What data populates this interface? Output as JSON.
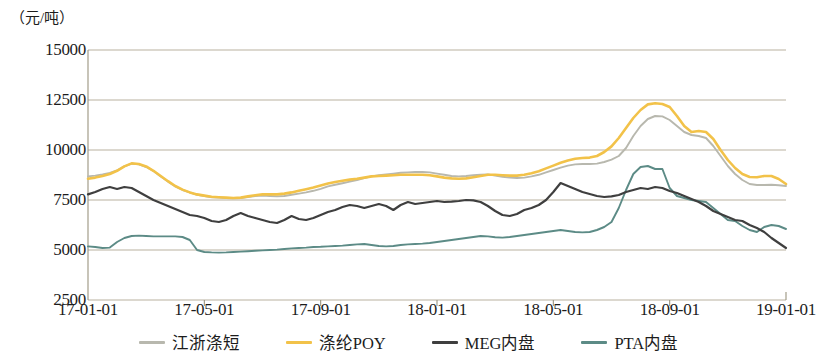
{
  "chart_data": {
    "type": "line",
    "title": "",
    "unit_label": "（元/吨）",
    "ylabel": "",
    "xlabel": "",
    "ylim": [
      2500,
      15000
    ],
    "yticks": [
      15000,
      12500,
      10000,
      7500,
      5000,
      2500
    ],
    "ytick_labels": [
      "15000",
      "12500",
      "10000",
      "7500",
      "5000",
      "2500"
    ],
    "xticks": [
      "17-01-01",
      "17-05-01",
      "17-09-01",
      "18-01-01",
      "18-05-01",
      "18-09-01",
      "19-01-01"
    ],
    "grid": true,
    "legend_position": "bottom",
    "x_start": "17-01-01",
    "x_end": "19-01-01",
    "series": [
      {
        "name": "江浙涤短",
        "color": "#b8b8ae",
        "values": [
          8680,
          8720,
          8780,
          8850,
          8980,
          9180,
          9320,
          9280,
          9150,
          8950,
          8680,
          8420,
          8180,
          8000,
          7880,
          7760,
          7700,
          7640,
          7620,
          7600,
          7580,
          7600,
          7650,
          7700,
          7720,
          7700,
          7680,
          7700,
          7760,
          7820,
          7880,
          7960,
          8060,
          8180,
          8260,
          8340,
          8420,
          8500,
          8600,
          8680,
          8740,
          8780,
          8820,
          8860,
          8880,
          8900,
          8900,
          8880,
          8820,
          8760,
          8700,
          8680,
          8700,
          8740,
          8760,
          8780,
          8720,
          8660,
          8620,
          8600,
          8620,
          8680,
          8760,
          8880,
          9000,
          9120,
          9220,
          9280,
          9300,
          9300,
          9320,
          9400,
          9520,
          9700,
          10100,
          10700,
          11200,
          11550,
          11700,
          11680,
          11500,
          11200,
          10900,
          10750,
          10700,
          10600,
          10200,
          9700,
          9200,
          8800,
          8500,
          8300,
          8250,
          8250,
          8260,
          8240,
          8200
        ]
      },
      {
        "name": "涤纶POY",
        "color": "#f2c249",
        "values": [
          8560,
          8620,
          8700,
          8800,
          8960,
          9180,
          9330,
          9300,
          9180,
          8960,
          8700,
          8440,
          8200,
          8020,
          7880,
          7780,
          7720,
          7660,
          7640,
          7620,
          7600,
          7620,
          7680,
          7740,
          7780,
          7780,
          7780,
          7820,
          7880,
          7960,
          8040,
          8120,
          8220,
          8320,
          8400,
          8460,
          8520,
          8560,
          8620,
          8680,
          8700,
          8720,
          8740,
          8760,
          8760,
          8760,
          8760,
          8740,
          8680,
          8620,
          8580,
          8560,
          8580,
          8640,
          8700,
          8760,
          8760,
          8740,
          8720,
          8720,
          8760,
          8840,
          8940,
          9080,
          9220,
          9360,
          9480,
          9560,
          9600,
          9620,
          9700,
          9900,
          10180,
          10600,
          11100,
          11600,
          12000,
          12280,
          12340,
          12300,
          12150,
          11700,
          11200,
          10900,
          10950,
          10900,
          10550,
          10000,
          9500,
          9100,
          8800,
          8650,
          8640,
          8700,
          8700,
          8550,
          8300
        ]
      },
      {
        "name": "MEG内盘",
        "color": "#3f3f3f",
        "values": [
          7780,
          7900,
          8050,
          8150,
          8050,
          8150,
          8100,
          7900,
          7700,
          7500,
          7350,
          7200,
          7050,
          6900,
          6750,
          6700,
          6600,
          6450,
          6400,
          6500,
          6700,
          6850,
          6700,
          6600,
          6500,
          6400,
          6350,
          6500,
          6700,
          6550,
          6500,
          6600,
          6750,
          6900,
          7000,
          7150,
          7250,
          7200,
          7100,
          7200,
          7300,
          7200,
          7000,
          7250,
          7400,
          7300,
          7350,
          7400,
          7450,
          7400,
          7420,
          7450,
          7500,
          7480,
          7400,
          7200,
          6950,
          6750,
          6700,
          6800,
          7000,
          7100,
          7250,
          7500,
          7900,
          8350,
          8200,
          8050,
          7900,
          7800,
          7700,
          7650,
          7680,
          7750,
          7900,
          8000,
          8100,
          8050,
          8150,
          8100,
          7950,
          7850,
          7700,
          7550,
          7400,
          7200,
          6950,
          6800,
          6650,
          6500,
          6450,
          6250,
          6100,
          5900,
          5600,
          5350,
          5100
        ]
      },
      {
        "name": "PTA内盘",
        "color": "#5c8b86"
      }
    ],
    "pta_values": [
      5180,
      5150,
      5100,
      5120,
      5400,
      5600,
      5700,
      5720,
      5700,
      5680,
      5680,
      5680,
      5680,
      5650,
      5500,
      5000,
      4900,
      4880,
      4870,
      4880,
      4900,
      4920,
      4940,
      4960,
      4980,
      5000,
      5020,
      5050,
      5080,
      5100,
      5120,
      5150,
      5160,
      5180,
      5200,
      5220,
      5250,
      5280,
      5300,
      5250,
      5200,
      5180,
      5200,
      5250,
      5280,
      5300,
      5320,
      5350,
      5400,
      5450,
      5500,
      5550,
      5600,
      5650,
      5700,
      5680,
      5640,
      5620,
      5650,
      5700,
      5750,
      5800,
      5850,
      5900,
      5950,
      6000,
      5950,
      5900,
      5880,
      5900,
      6000,
      6150,
      6400,
      7100,
      8000,
      8800,
      9150,
      9200,
      9050,
      9050,
      8100,
      7700,
      7600,
      7500,
      7450,
      7400,
      7100,
      6800,
      6500,
      6450,
      6200,
      6000,
      5900,
      6150,
      6250,
      6200,
      6050
    ]
  },
  "legend": {
    "items": [
      {
        "label": "江浙涤短",
        "color": "#b8b8ae"
      },
      {
        "label": "涤纶POY",
        "color": "#f2c249"
      },
      {
        "label": "MEG内盘",
        "color": "#3f3f3f"
      },
      {
        "label": "PTA内盘",
        "color": "#5c8b86"
      }
    ]
  }
}
